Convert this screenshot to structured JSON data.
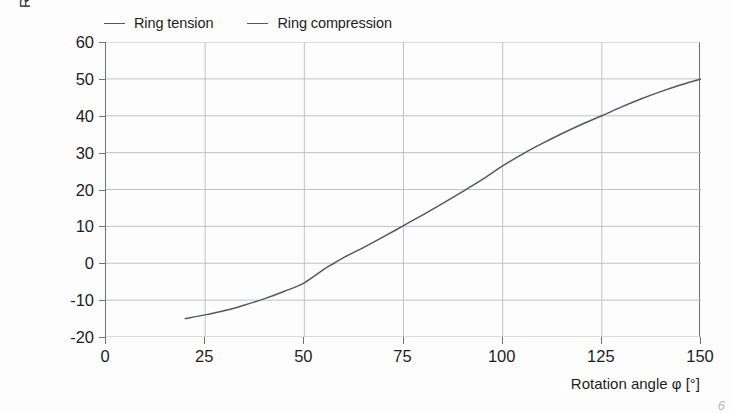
{
  "chart_data": {
    "type": "line",
    "title": "",
    "xlabel": "Rotation angle φ [°]",
    "ylabel": "Ring normal force [kN]",
    "xlim": [
      0,
      150
    ],
    "ylim": [
      -20,
      60
    ],
    "xticks": [
      0,
      25,
      50,
      75,
      100,
      125,
      150
    ],
    "yticks": [
      -20,
      -10,
      0,
      10,
      20,
      30,
      40,
      50,
      60
    ],
    "xtick_labels": [
      "0",
      "25",
      "50",
      "75",
      "100",
      "125",
      "150"
    ],
    "ytick_labels": [
      "-20",
      "-10",
      "0",
      "10",
      "20",
      "30",
      "40",
      "50",
      "60"
    ],
    "grid": true,
    "grid_axis": "both",
    "legend_position": "above-left",
    "legend": [
      "Ring tension",
      "Ring compression"
    ],
    "series": [
      {
        "name": "Ring compression / Ring tension",
        "color": "#55595d",
        "x": [
          20,
          25,
          30,
          35,
          40,
          45,
          50,
          55,
          57.5,
          60,
          65,
          70,
          75,
          80,
          85,
          90,
          95,
          100,
          105,
          110,
          115,
          120,
          125,
          130,
          135,
          140,
          145,
          150
        ],
        "y": [
          -15.0,
          -14.0,
          -12.8,
          -11.3,
          -9.6,
          -7.6,
          -5.3,
          -1.6,
          0.0,
          1.6,
          4.3,
          7.2,
          10.2,
          13.2,
          16.3,
          19.5,
          22.8,
          26.4,
          29.6,
          32.5,
          35.2,
          37.7,
          40.0,
          42.4,
          44.6,
          46.6,
          48.4,
          50.0
        ]
      }
    ],
    "annotations": []
  },
  "legend": {
    "entries": [
      {
        "label": "Ring tension",
        "marker": "line-dash"
      },
      {
        "label": "Ring compression",
        "marker": "line-dash"
      }
    ]
  },
  "axes": {
    "y_title": "Ring normal force [kN]",
    "x_title": "Rotation angle φ [°]",
    "y_labels": [
      "60",
      "50",
      "40",
      "30",
      "20",
      "10",
      "0",
      "-10",
      "-20"
    ],
    "x_labels": [
      "0",
      "25",
      "50",
      "75",
      "100",
      "125",
      "150"
    ]
  },
  "artifact": {
    "corner_mark": "6"
  },
  "colors": {
    "background": "#fdfdfd",
    "grid": "#b9bcbf",
    "axis": "#6c7276",
    "curve": "#55595d",
    "text": "#1d1d1d"
  }
}
